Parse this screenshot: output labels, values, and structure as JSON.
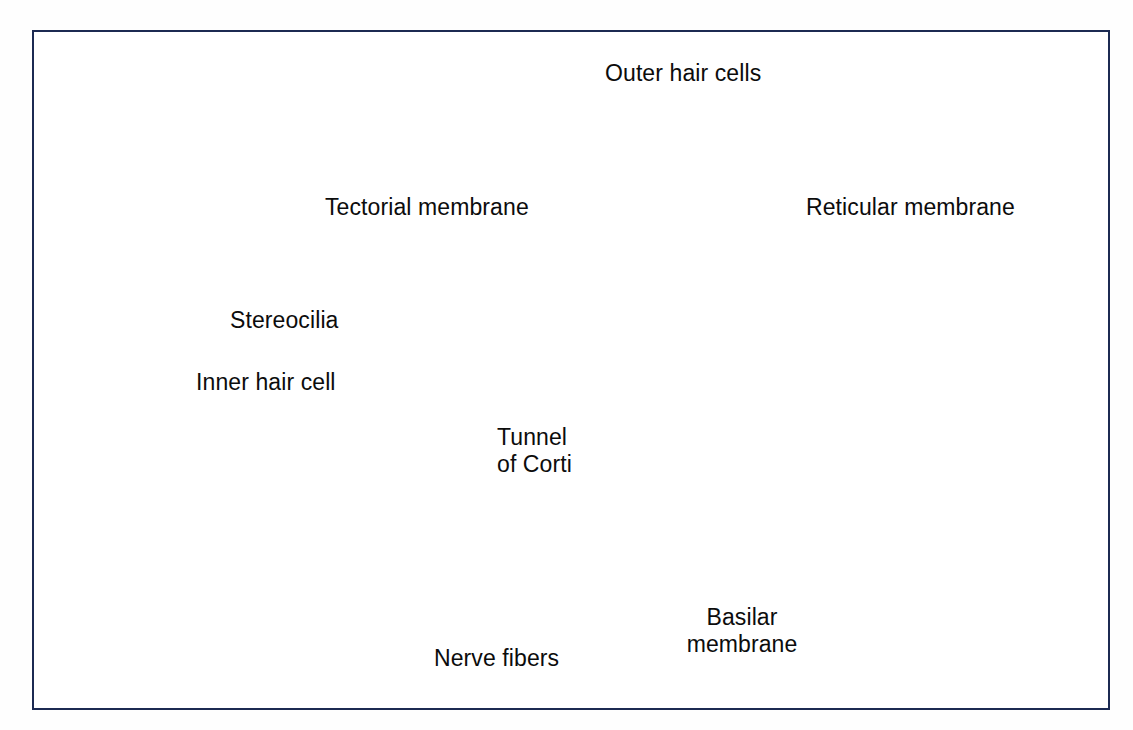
{
  "figure": {
    "border_color": "#1c2a52",
    "background": "#ffffff"
  },
  "labels": {
    "outer_hair_cells": "Outer hair cells",
    "tectorial_membrane": "Tectorial membrane",
    "reticular_membrane": "Reticular membrane",
    "stereocilia": "Stereocilia",
    "inner_hair_cell": "Inner hair cell",
    "tunnel_of_corti_line1": "Tunnel",
    "tunnel_of_corti_line2": "of Corti",
    "nerve_fibers": "Nerve fibers",
    "basilar_membrane_line1": "Basilar",
    "basilar_membrane_line2": "membrane"
  },
  "palette": {
    "leader_line": "#101010",
    "tectorial_membrane": "#aab6c6",
    "tectorial_membrane_dark": "#5b6a80",
    "reticular_membrane": "#5c6b60",
    "hair_cell_body": "#b49dad",
    "hair_cell_dark": "#6e5468",
    "hair_cell_nucleus": "#5a4257",
    "supporting_cell": "#ece0df",
    "supporting_cell_outline": "#9a6a6f",
    "epithelium_fill": "#e8d9d7",
    "basilar_membrane": "#f4998c",
    "basilar_membrane_deep": "#e8705f",
    "nerve_fiber": "#ded59a",
    "nerve_fiber_outline": "#b5a85c",
    "limbus_band": "#f4eed7"
  },
  "structures": [
    {
      "name": "tectorial-membrane",
      "description": "striated blue-grey gelatinous flap sweeping from upper left to the hair cell tips"
    },
    {
      "name": "reticular-membrane",
      "description": "dark grey-green line capping the hair cells"
    },
    {
      "name": "outer-hair-cells",
      "description": "three elongated mauve cells with dark nuclei",
      "count": 3
    },
    {
      "name": "inner-hair-cell",
      "description": "single flask shaped mauve cell left of the tunnel",
      "count": 1
    },
    {
      "name": "tunnel-of-corti",
      "description": "triangular space between inner and outer pillar cells"
    },
    {
      "name": "basilar-membrane",
      "description": "salmon striated band running along the floor"
    },
    {
      "name": "nerve-fibers",
      "description": "yellow fibre bundles leaving the hair cell bases toward lower left"
    },
    {
      "name": "spiral-limbus-epithelium",
      "description": "arc of pale epithelial cells on the left"
    },
    {
      "name": "hensen-claudius-cells",
      "description": "mound of pale supporting cells tapering to the right"
    },
    {
      "name": "upper-epithelial-band",
      "description": "band of epithelial cells at the top left (Reissner / vestibular surface)"
    }
  ]
}
